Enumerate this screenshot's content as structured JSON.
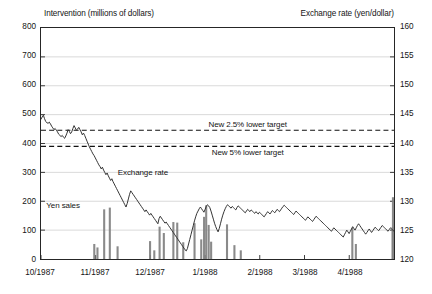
{
  "chart_data": {
    "type": "line",
    "title": "",
    "xlabel": "",
    "ylabel": "Intervention (millions of dollars)",
    "y2label": "Exchange rate (yen/dollar)",
    "ylim": [
      0,
      800
    ],
    "y2lim": [
      120,
      160
    ],
    "grid": true,
    "legend_position": "inline-annotations",
    "left_axis": {
      "title": "Intervention (millions of dollars)",
      "ticks": [
        "0",
        "100",
        "200",
        "300",
        "400",
        "500",
        "600",
        "700",
        "800"
      ],
      "min": 0,
      "max": 800,
      "step": 100
    },
    "right_axis": {
      "title": "Exchange rate (yen/dollar)",
      "ticks": [
        "120",
        "125",
        "130",
        "135",
        "140",
        "145",
        "150",
        "155",
        "160"
      ],
      "min": 120,
      "max": 160,
      "step": 5
    },
    "x_axis": {
      "tick_labels": [
        "10/1987",
        "11/1987",
        "12/1987",
        "1/1988",
        "2/1988",
        "3/1988",
        "4/1988"
      ],
      "tick_positions": [
        0,
        0.1549,
        0.3099,
        0.4648,
        0.6197,
        0.7465,
        0.8732
      ]
    },
    "annotations": [
      {
        "name": "upper-target-label",
        "text": "New 2.5% lower target",
        "x_frac": 0.585,
        "value_right_axis": 142.3
      },
      {
        "name": "lower-target-label",
        "text": "New 5% lower target",
        "x_frac": 0.585,
        "value_right_axis": 139.5
      },
      {
        "name": "exchange-rate-label",
        "text": "Exchange rate",
        "x_frac": 0.29,
        "value_right_axis": 135.0
      },
      {
        "name": "yen-sales-label",
        "text": "Yen sales",
        "x_frac": 0.065,
        "value_left_axis": 185
      }
    ],
    "reference_lines": [
      {
        "name": "new-2.5-percent-lower-target",
        "value": 142.3,
        "axis": "right",
        "style": "dashed"
      },
      {
        "name": "new-5-percent-lower-target",
        "value": 139.5,
        "axis": "right",
        "style": "dashed"
      }
    ],
    "series": [
      {
        "name": "Exchange rate",
        "type": "line",
        "axis": "right",
        "unit": "yen/dollar",
        "color": "#333333",
        "values": [
          144.2,
          144.6,
          144.9,
          144.3,
          143.8,
          143.6,
          143.5,
          143.7,
          143.4,
          143.0,
          142.7,
          142.4,
          142.6,
          142.3,
          142.0,
          141.6,
          141.4,
          141.2,
          141.4,
          141.1,
          140.9,
          141.3,
          141.8,
          142.4,
          142.1,
          141.7,
          142.0,
          142.6,
          143.1,
          142.7,
          142.3,
          142.5,
          142.8,
          142.4,
          142.0,
          141.5,
          141.8,
          141.4,
          140.9,
          140.4,
          139.9,
          139.4,
          139.0,
          138.6,
          138.2,
          137.9,
          137.5,
          137.1,
          136.7,
          136.3,
          136.0,
          135.6,
          135.9,
          135.4,
          135.0,
          134.6,
          134.9,
          134.4,
          134.0,
          133.6,
          133.9,
          133.4,
          133.0,
          132.6,
          132.2,
          131.8,
          131.4,
          131.0,
          130.6,
          130.2,
          129.8,
          129.4,
          129.0,
          129.6,
          130.4,
          131.2,
          131.8,
          131.5,
          131.2,
          130.9,
          130.6,
          130.3,
          130.0,
          129.7,
          129.4,
          129.1,
          128.8,
          128.5,
          128.2,
          128.5,
          128.2,
          127.9,
          127.6,
          127.9,
          127.6,
          127.3,
          127.0,
          126.7,
          126.4,
          126.1,
          127.0,
          127.4,
          127.1,
          126.8,
          126.5,
          126.2,
          126.4,
          126.1,
          125.8,
          125.5,
          125.2,
          124.9,
          124.6,
          124.3,
          124.0,
          123.7,
          123.4,
          123.1,
          122.8,
          122.5,
          122.2,
          121.9,
          121.6,
          121.4,
          121.8,
          122.6,
          123.4,
          124.2,
          125.0,
          125.8,
          126.6,
          127.3,
          127.9,
          128.3,
          128.7,
          129.0,
          128.7,
          128.4,
          128.1,
          128.6,
          129.1,
          129.4,
          129.2,
          128.9,
          128.3,
          127.6,
          126.9,
          126.2,
          125.6,
          125.1,
          124.7,
          125.3,
          126.1,
          126.9,
          127.6,
          128.2,
          128.7,
          129.1,
          129.4,
          129.2,
          129.0,
          128.8,
          129.1,
          128.9,
          128.7,
          128.5,
          128.9,
          129.2,
          129.0,
          128.8,
          128.6,
          128.4,
          128.2,
          128.0,
          128.3,
          128.6,
          128.4,
          128.2,
          128.5,
          128.3,
          128.1,
          127.9,
          128.2,
          128.0,
          127.8,
          128.1,
          127.9,
          127.7,
          127.5,
          127.3,
          127.6,
          127.9,
          128.2,
          128.0,
          127.8,
          128.1,
          128.4,
          128.2,
          128.0,
          128.3,
          128.6,
          128.4,
          128.2,
          128.5,
          128.8,
          129.1,
          129.3,
          129.1,
          128.9,
          128.7,
          128.5,
          128.3,
          128.1,
          127.9,
          127.7,
          128.0,
          128.3,
          128.1,
          127.9,
          127.7,
          127.5,
          127.3,
          127.1,
          126.9,
          126.7,
          127.0,
          127.3,
          127.1,
          126.9,
          126.7,
          126.5,
          126.8,
          127.1,
          127.4,
          127.2,
          127.0,
          126.8,
          126.6,
          126.4,
          126.2,
          126.0,
          125.8,
          125.6,
          125.4,
          125.2,
          125.0,
          124.8,
          125.1,
          125.4,
          125.2,
          125.0,
          124.8,
          124.6,
          124.4,
          124.2,
          124.0,
          123.8,
          124.2,
          124.6,
          125.0,
          124.7,
          124.4,
          124.8,
          125.2,
          125.6,
          125.3,
          125.0,
          125.4,
          125.8,
          126.1,
          125.8,
          125.5,
          125.2,
          124.9,
          124.6,
          124.3,
          124.6,
          124.9,
          125.2,
          124.9,
          124.6,
          124.9,
          125.2,
          125.5,
          125.3,
          125.1,
          124.9,
          125.2,
          125.5,
          125.8,
          125.6,
          125.4,
          125.2,
          125.0,
          124.8,
          125.1,
          125.4,
          125.2,
          125.0,
          124.8
        ]
      },
      {
        "name": "Yen sales",
        "type": "bar",
        "axis": "left",
        "unit": "millions of dollars",
        "color": "#808080",
        "bars": [
          {
            "x_frac": 0.148,
            "value": 52
          },
          {
            "x_frac": 0.157,
            "value": 40
          },
          {
            "x_frac": 0.176,
            "value": 172
          },
          {
            "x_frac": 0.192,
            "value": 178
          },
          {
            "x_frac": 0.214,
            "value": 44
          },
          {
            "x_frac": 0.306,
            "value": 62
          },
          {
            "x_frac": 0.318,
            "value": 30
          },
          {
            "x_frac": 0.333,
            "value": 112
          },
          {
            "x_frac": 0.345,
            "value": 90
          },
          {
            "x_frac": 0.372,
            "value": 128
          },
          {
            "x_frac": 0.383,
            "value": 126
          },
          {
            "x_frac": 0.4,
            "value": 58
          },
          {
            "x_frac": 0.432,
            "value": 124
          },
          {
            "x_frac": 0.451,
            "value": 68
          },
          {
            "x_frac": 0.459,
            "value": 146
          },
          {
            "x_frac": 0.465,
            "value": 186
          },
          {
            "x_frac": 0.472,
            "value": 118
          },
          {
            "x_frac": 0.479,
            "value": 60
          },
          {
            "x_frac": 0.524,
            "value": 120
          },
          {
            "x_frac": 0.545,
            "value": 48
          },
          {
            "x_frac": 0.563,
            "value": 30
          },
          {
            "x_frac": 0.879,
            "value": 108
          },
          {
            "x_frac": 0.889,
            "value": 52
          },
          {
            "x_frac": 0.993,
            "value": 110
          },
          {
            "x_frac": 1.0,
            "value": 214
          }
        ]
      }
    ]
  },
  "caption": ""
}
